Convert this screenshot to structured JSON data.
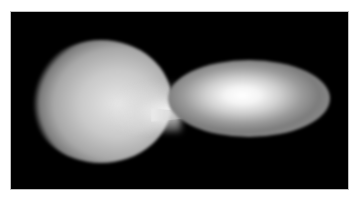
{
  "image": {
    "description": "Grayscale illustration of an interacting binary star system: a distorted teardrop-shaped star on the left transferring mass via a stream to an elliptical accretion disk with a bright core on the right, on a black background",
    "background_color": "#000000",
    "frame_color": "#ffffff",
    "objects": [
      {
        "name": "donor-star",
        "shape": "teardrop",
        "tone": "light gray"
      },
      {
        "name": "mass-transfer-stream",
        "shape": "narrow stream",
        "tone": "white"
      },
      {
        "name": "accretion-disk",
        "shape": "ellipse",
        "tone": "gray rings with bright white center"
      }
    ]
  }
}
